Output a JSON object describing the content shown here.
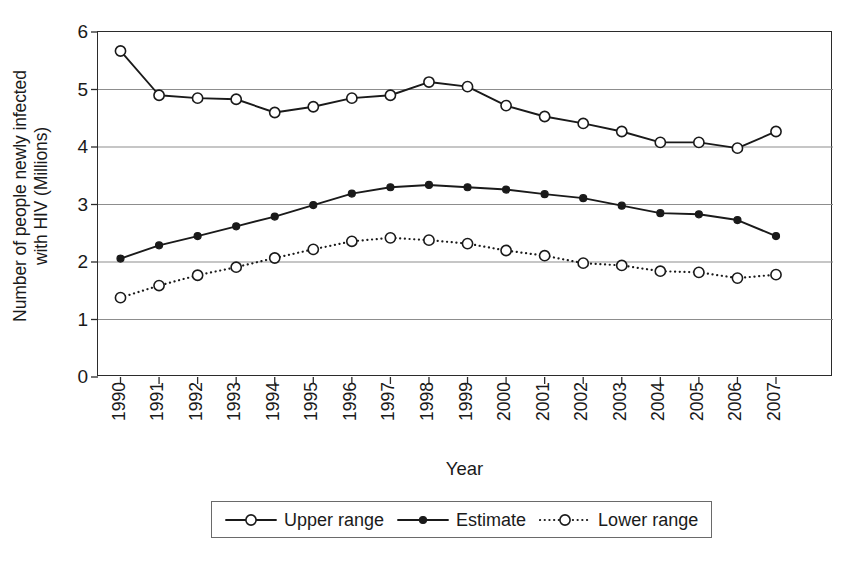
{
  "chart_data": {
    "type": "line",
    "title": "",
    "xlabel": "Year",
    "ylabel": "Number of people newly infected with HIV (Millions)",
    "ylabel_lines": [
      "Number of people newly infected",
      "with HIV (Millions)"
    ],
    "categories": [
      "1990",
      "1991",
      "1992",
      "1993",
      "1994",
      "1995",
      "1996",
      "1997",
      "1998",
      "1999",
      "2000",
      "2001",
      "2002",
      "2003",
      "2004",
      "2005",
      "2006",
      "2007"
    ],
    "x": [
      1990,
      1991,
      1992,
      1993,
      1994,
      1995,
      1996,
      1997,
      1998,
      1999,
      2000,
      2001,
      2002,
      2003,
      2004,
      2005,
      2006,
      2007
    ],
    "ylim": [
      0,
      6
    ],
    "yticks": [
      0,
      1,
      2,
      3,
      4,
      5,
      6
    ],
    "ytick_labels": [
      "0",
      "1",
      "2",
      "3",
      "4",
      "5",
      "6"
    ],
    "grid": "horizontal",
    "legend_position": "bottom-center",
    "series": [
      {
        "name": "Upper range",
        "marker": "open-circle",
        "line": "solid",
        "color": "#1a1a1a",
        "values": [
          5.67,
          4.9,
          4.85,
          4.83,
          4.6,
          4.7,
          4.85,
          4.9,
          5.13,
          5.05,
          4.72,
          4.53,
          4.41,
          4.27,
          4.08,
          4.08,
          3.98,
          4.27
        ]
      },
      {
        "name": "Estimate",
        "marker": "filled-circle",
        "line": "solid",
        "color": "#1a1a1a",
        "values": [
          2.06,
          2.29,
          2.45,
          2.62,
          2.79,
          2.99,
          3.19,
          3.3,
          3.34,
          3.3,
          3.26,
          3.18,
          3.11,
          2.98,
          2.85,
          2.83,
          2.73,
          2.45
        ]
      },
      {
        "name": "Lower range",
        "marker": "open-circle",
        "line": "dotted",
        "color": "#1a1a1a",
        "values": [
          1.38,
          1.59,
          1.77,
          1.91,
          2.07,
          2.22,
          2.36,
          2.42,
          2.38,
          2.32,
          2.2,
          2.11,
          1.98,
          1.94,
          1.84,
          1.82,
          1.72,
          1.78
        ]
      }
    ]
  },
  "legend": {
    "items": [
      {
        "label": "Upper range",
        "key": "open-circle-solid-line-key"
      },
      {
        "label": "Estimate",
        "key": "filled-circle-solid-line-key"
      },
      {
        "label": "Lower range",
        "key": "open-circle-dotted-line-key"
      }
    ]
  },
  "axes": {
    "y_title_line1": "Number of people newly infected",
    "y_title_line2": "with HIV (Millions)",
    "x_title": "Year"
  }
}
